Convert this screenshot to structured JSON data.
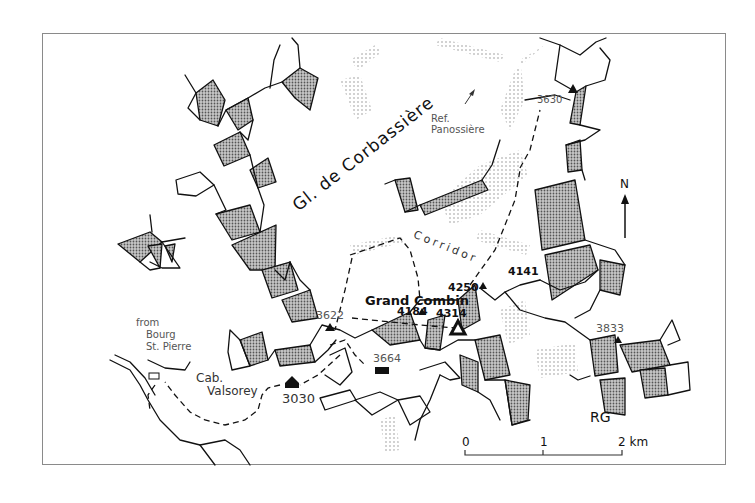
{
  "map": {
    "glacier_name": "Gl. de Corbassière",
    "corridor_label": "Corridor",
    "refuge_label_line1": "Ref.",
    "refuge_label_line2": "Panossière",
    "summit_name": "Grand Combin",
    "region_label": "RG",
    "from_label_line1": "from",
    "from_label_line2": "Bourg",
    "from_label_line3": "St. Pierre",
    "cabin_label_line1": "Cab.",
    "cabin_label_line2": "Valsorey",
    "north_label": "N",
    "elevations": {
      "e3630": "3630",
      "e3622": "3622",
      "e3664": "3664",
      "e3030": "3030",
      "e4184": "4184",
      "e4314": "4314",
      "e4250": "4250",
      "e4141": "4141",
      "e3833": "3833"
    },
    "scale_bar": {
      "tick0": "0",
      "tick1": "1",
      "tick2": "2 km"
    },
    "colors": {
      "frame": "#8a8a8a",
      "ridge_line": "#111111",
      "stipple_fill": "#9a9a9a",
      "hatch": "#b5b5b5",
      "text": "#333333"
    }
  }
}
